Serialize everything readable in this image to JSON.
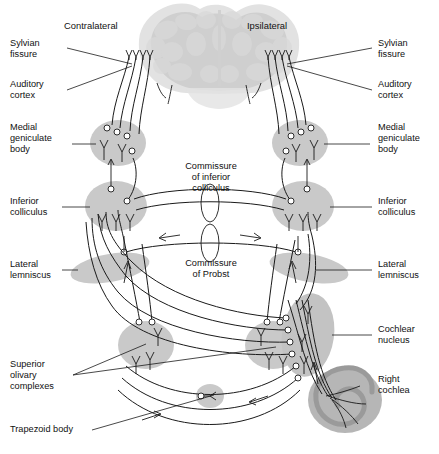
{
  "figure": {
    "type": "anatomical-diagram",
    "background_color": "#ffffff",
    "structure_fill": "#c9c9c9",
    "brain_fill": "#d9d9d9",
    "line_color": "#1a1a1a"
  },
  "headers": {
    "left": "Contralateral",
    "right": "Ipsilateral"
  },
  "labels_left": [
    {
      "id": "sylvian-fissure",
      "text": "Sylvian\nfissure"
    },
    {
      "id": "auditory-cortex",
      "text": "Auditory\ncortex"
    },
    {
      "id": "medial-geniculate",
      "text": "Medial\ngeniculate\nbody"
    },
    {
      "id": "inferior-colliculus",
      "text": "Inferior\ncolliculus"
    },
    {
      "id": "lateral-lemniscus",
      "text": "Lateral\nlemniscus"
    },
    {
      "id": "superior-olivary",
      "text": "Superior\nolivary\ncomplexes"
    },
    {
      "id": "trapezoid-body",
      "text": "Trapezoid body"
    }
  ],
  "labels_right": [
    {
      "id": "sylvian-fissure",
      "text": "Sylvian\nfissure"
    },
    {
      "id": "auditory-cortex",
      "text": "Auditory\ncortex"
    },
    {
      "id": "medial-geniculate",
      "text": "Medial\ngeniculate\nbody"
    },
    {
      "id": "inferior-colliculus",
      "text": "Inferior\ncolliculus"
    },
    {
      "id": "lateral-lemniscus",
      "text": "Lateral\nlemniscus"
    },
    {
      "id": "cochlear-nucleus",
      "text": "Cochlear\nnucleus"
    },
    {
      "id": "right-cochlea",
      "text": "Right\ncochlea"
    }
  ],
  "labels_center": [
    {
      "id": "commissure-inferior-colliculus",
      "text": "Commissure\nof inferior\ncolliculus"
    },
    {
      "id": "commissure-probst",
      "text": "Commissure\nof Probst"
    }
  ]
}
